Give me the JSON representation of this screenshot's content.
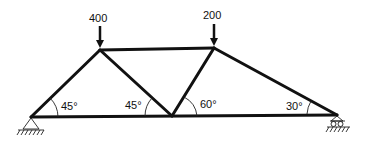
{
  "diagram": {
    "type": "truss",
    "loads": [
      {
        "value": "400",
        "node": "top-left"
      },
      {
        "value": "200",
        "node": "top-right"
      }
    ],
    "angles": [
      {
        "label": "45°",
        "at": "left-support"
      },
      {
        "label": "45°",
        "at": "bottom-middle-left"
      },
      {
        "label": "60°",
        "at": "bottom-middle-right"
      },
      {
        "label": "30°",
        "at": "right-support"
      }
    ],
    "supports": [
      {
        "type": "pin",
        "node": "left-support"
      },
      {
        "type": "roller",
        "node": "right-support"
      }
    ],
    "colors": {
      "line": "#111111",
      "background": "#ffffff"
    }
  }
}
